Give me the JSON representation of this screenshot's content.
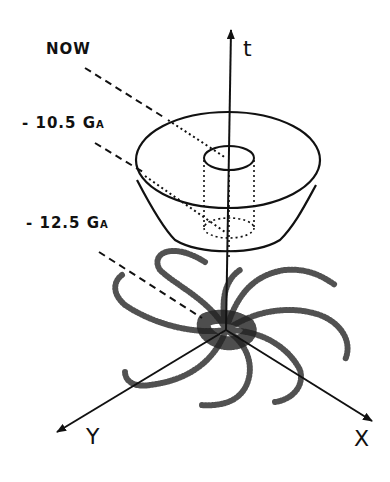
{
  "diagram": {
    "type": "spacetime-cone",
    "axes": {
      "t": {
        "label": "t"
      },
      "x": {
        "label": "X"
      },
      "y": {
        "label": "Y"
      }
    },
    "time_labels": [
      {
        "id": "now",
        "text": "NOW"
      },
      {
        "id": "minus-10-5",
        "value": "- 10.5",
        "unit": "GA",
        "unit_main": "G",
        "unit_sub": "A"
      },
      {
        "id": "minus-12-5",
        "value": "- 12.5",
        "unit": "GA",
        "unit_main": "G",
        "unit_sub": "A"
      }
    ],
    "elements": [
      "truncated cone",
      "inner cylinder (dotted)",
      "spiral galaxy (stippled)",
      "dashed leader lines"
    ],
    "colors": {
      "ink": "#111111",
      "background": "#ffffff"
    }
  }
}
